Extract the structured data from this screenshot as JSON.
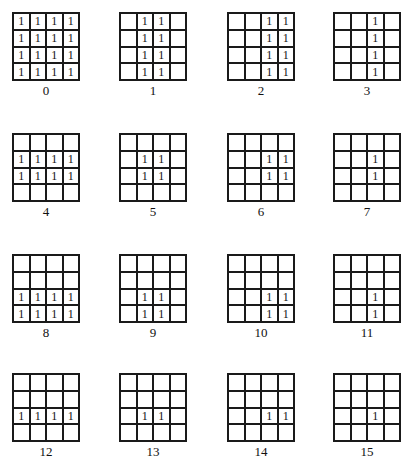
{
  "figure": {
    "panels": [
      {
        "label": "0",
        "rows": [
          [
            "1",
            "1",
            "1",
            "1"
          ],
          [
            "1",
            "1",
            "1",
            "1"
          ],
          [
            "1",
            "1",
            "1",
            "1"
          ],
          [
            "1",
            "1",
            "1",
            "1"
          ]
        ]
      },
      {
        "label": "1",
        "rows": [
          [
            "",
            "1",
            "1",
            ""
          ],
          [
            "",
            "1",
            "1",
            ""
          ],
          [
            "",
            "1",
            "1",
            ""
          ],
          [
            "",
            "1",
            "1",
            ""
          ]
        ]
      },
      {
        "label": "2",
        "rows": [
          [
            "",
            "",
            "1",
            "1"
          ],
          [
            "",
            "",
            "1",
            "1"
          ],
          [
            "",
            "",
            "1",
            "1"
          ],
          [
            "",
            "",
            "1",
            "1"
          ]
        ]
      },
      {
        "label": "3",
        "rows": [
          [
            "",
            "",
            "1",
            ""
          ],
          [
            "",
            "",
            "1",
            ""
          ],
          [
            "",
            "",
            "1",
            ""
          ],
          [
            "",
            "",
            "1",
            ""
          ]
        ]
      },
      {
        "label": "4",
        "rows": [
          [
            "",
            "",
            "",
            ""
          ],
          [
            "1",
            "1",
            "1",
            "1"
          ],
          [
            "1",
            "1",
            "1",
            "1"
          ],
          [
            "",
            "",
            "",
            ""
          ]
        ]
      },
      {
        "label": "5",
        "rows": [
          [
            "",
            "",
            "",
            ""
          ],
          [
            "",
            "1",
            "1",
            ""
          ],
          [
            "",
            "1",
            "1",
            ""
          ],
          [
            "",
            "",
            "",
            ""
          ]
        ]
      },
      {
        "label": "6",
        "rows": [
          [
            "",
            "",
            "",
            ""
          ],
          [
            "",
            "",
            "1",
            "1"
          ],
          [
            "",
            "",
            "1",
            "1"
          ],
          [
            "",
            "",
            "",
            ""
          ]
        ]
      },
      {
        "label": "7",
        "rows": [
          [
            "",
            "",
            "",
            ""
          ],
          [
            "",
            "",
            "1",
            ""
          ],
          [
            "",
            "",
            "1",
            ""
          ],
          [
            "",
            "",
            "",
            ""
          ]
        ]
      },
      {
        "label": "8",
        "rows": [
          [
            "",
            "",
            "",
            ""
          ],
          [
            "",
            "",
            "",
            ""
          ],
          [
            "1",
            "1",
            "1",
            "1"
          ],
          [
            "1",
            "1",
            "1",
            "1"
          ]
        ]
      },
      {
        "label": "9",
        "rows": [
          [
            "",
            "",
            "",
            ""
          ],
          [
            "",
            "",
            "",
            ""
          ],
          [
            "",
            "1",
            "1",
            ""
          ],
          [
            "",
            "1",
            "1",
            ""
          ]
        ]
      },
      {
        "label": "10",
        "rows": [
          [
            "",
            "",
            "",
            ""
          ],
          [
            "",
            "",
            "",
            ""
          ],
          [
            "",
            "",
            "1",
            "1"
          ],
          [
            "",
            "",
            "1",
            "1"
          ]
        ]
      },
      {
        "label": "11",
        "rows": [
          [
            "",
            "",
            "",
            ""
          ],
          [
            "",
            "",
            "",
            ""
          ],
          [
            "",
            "",
            "1",
            ""
          ],
          [
            "",
            "",
            "1",
            ""
          ]
        ]
      },
      {
        "label": "12",
        "rows": [
          [
            "",
            "",
            "",
            ""
          ],
          [
            "",
            "",
            "",
            ""
          ],
          [
            "1",
            "1",
            "1",
            "1"
          ],
          [
            "",
            "",
            "",
            ""
          ]
        ]
      },
      {
        "label": "13",
        "rows": [
          [
            "",
            "",
            "",
            ""
          ],
          [
            "",
            "",
            "",
            ""
          ],
          [
            "",
            "1",
            "1",
            ""
          ],
          [
            "",
            "",
            "",
            ""
          ]
        ]
      },
      {
        "label": "14",
        "rows": [
          [
            "",
            "",
            "",
            ""
          ],
          [
            "",
            "",
            "",
            ""
          ],
          [
            "",
            "",
            "1",
            "1"
          ],
          [
            "",
            "",
            "",
            ""
          ]
        ]
      },
      {
        "label": "15",
        "rows": [
          [
            "",
            "",
            "",
            ""
          ],
          [
            "",
            "",
            "",
            ""
          ],
          [
            "",
            "",
            "1",
            ""
          ],
          [
            "",
            "",
            "",
            ""
          ]
        ]
      }
    ]
  }
}
